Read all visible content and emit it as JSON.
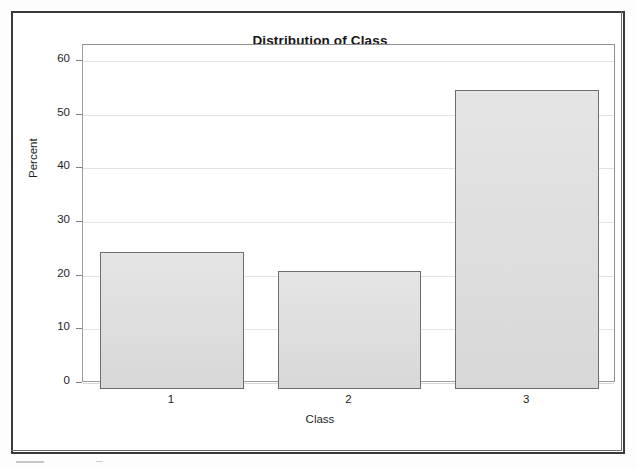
{
  "figure": {
    "title": "Distribution of Class",
    "background_color": "#ffffff",
    "frame_color": "#3a3a3a"
  },
  "axes": {
    "y_title": "Percent",
    "x_title": "Class",
    "y_ticks": [
      "0",
      "10",
      "20",
      "30",
      "40",
      "50",
      "60"
    ],
    "x_ticks": [
      "1",
      "2",
      "3"
    ]
  },
  "style": {
    "bar_fill": "#dcdcdc",
    "bar_border": "#6e6e6e",
    "gridline_color": "#e2e2e2",
    "axis_color": "#9b9b9b",
    "text_color": "#1d1d1d"
  },
  "chart_data": {
    "type": "bar",
    "title": "Distribution of Class",
    "xlabel": "Class",
    "ylabel": "Percent",
    "categories": [
      "1",
      "2",
      "3"
    ],
    "values": [
      24.5,
      20.9,
      54.6
    ],
    "ylim": [
      0,
      63
    ],
    "ytick_values": [
      0,
      10,
      20,
      30,
      40,
      50,
      60
    ],
    "grid": true,
    "legend": false,
    "bar_baseline_overshoot": true
  }
}
